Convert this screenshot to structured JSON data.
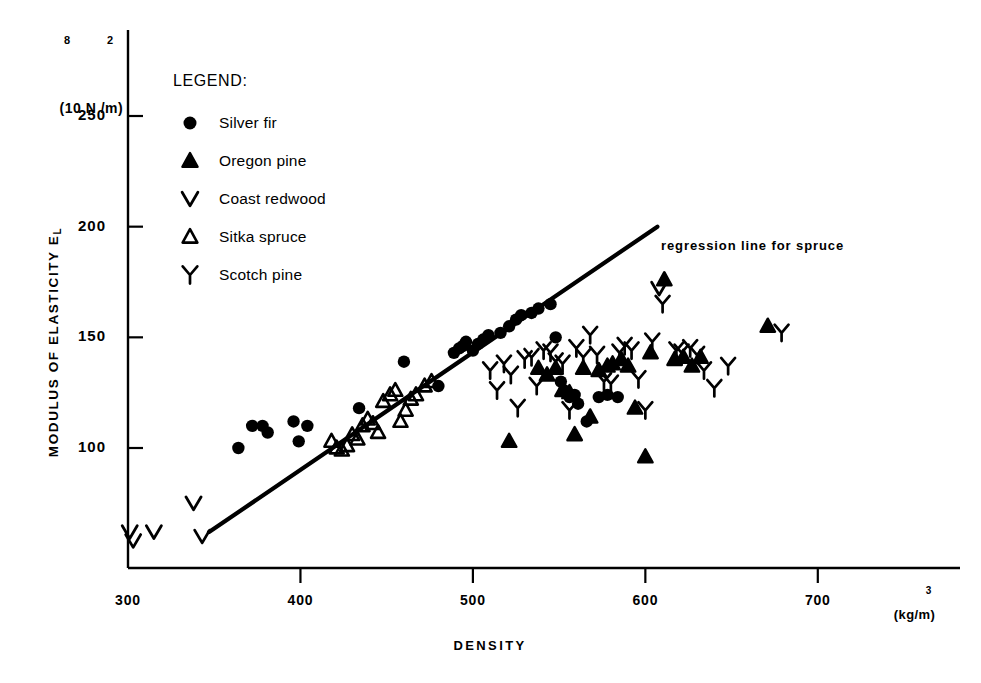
{
  "chart_data": {
    "type": "scatter",
    "title": "",
    "xlabel": "DENSITY",
    "xunit": "(kg/m",
    "xunit_exp": "3",
    "xunit_close": ")",
    "ylabel": "MODULUS OF ELASTICITY E",
    "ylabel_sub": "L",
    "yunit_open": "(10",
    "yunit_exp1": "8",
    "yunit_mid": " N /m",
    "yunit_exp2": "2",
    "yunit_close": ")",
    "xlim": [
      300,
      730
    ],
    "ylim": [
      55,
      270
    ],
    "xticks": [
      300,
      400,
      500,
      600,
      700
    ],
    "xtick_labels": [
      "300",
      "400",
      "500",
      "600",
      "700"
    ],
    "yticks": [
      100,
      150,
      200,
      250
    ],
    "ytick_labels": [
      "100",
      "150",
      "200",
      "250"
    ],
    "grid": false,
    "legend_position": "upper-left-inside",
    "legend_title": "LEGEND:",
    "annotations": [
      {
        "text": "regression line for spruce",
        "x": 615,
        "y": 197
      }
    ],
    "regression_line": {
      "label": "regression line for spruce",
      "x_start": 347,
      "y_start": 62,
      "x_end": 607,
      "y_end": 200
    },
    "series": [
      {
        "name": "Silver fir",
        "marker": "filled-circle",
        "color": "#000000",
        "points": [
          [
            364,
            100
          ],
          [
            372,
            110
          ],
          [
            378,
            110
          ],
          [
            381,
            107
          ],
          [
            396,
            112
          ],
          [
            399,
            103
          ],
          [
            404,
            110
          ],
          [
            434,
            118
          ],
          [
            460,
            139
          ],
          [
            480,
            128
          ],
          [
            489,
            143
          ],
          [
            492,
            145
          ],
          [
            494,
            146
          ],
          [
            496,
            148
          ],
          [
            500,
            144
          ],
          [
            503,
            147
          ],
          [
            506,
            149
          ],
          [
            509,
            151
          ],
          [
            516,
            152
          ],
          [
            521,
            155
          ],
          [
            525,
            158
          ],
          [
            528,
            160
          ],
          [
            534,
            161
          ],
          [
            538,
            163
          ],
          [
            545,
            165
          ],
          [
            548,
            150
          ],
          [
            551,
            130
          ],
          [
            553,
            126
          ],
          [
            556,
            123
          ],
          [
            559,
            124
          ],
          [
            561,
            120
          ],
          [
            566,
            112
          ],
          [
            573,
            123
          ],
          [
            578,
            124
          ],
          [
            584,
            123
          ]
        ]
      },
      {
        "name": "Oregon pine",
        "marker": "filled-triangle",
        "color": "#000000",
        "points": [
          [
            521,
            103
          ],
          [
            538,
            136
          ],
          [
            543,
            133
          ],
          [
            548,
            136
          ],
          [
            552,
            126
          ],
          [
            556,
            125
          ],
          [
            559,
            106
          ],
          [
            564,
            136
          ],
          [
            568,
            114
          ],
          [
            573,
            135
          ],
          [
            578,
            137
          ],
          [
            581,
            138
          ],
          [
            586,
            140
          ],
          [
            590,
            137
          ],
          [
            594,
            118
          ],
          [
            600,
            96
          ],
          [
            603,
            143
          ],
          [
            611,
            176
          ],
          [
            617,
            140
          ],
          [
            622,
            141
          ],
          [
            627,
            137
          ],
          [
            632,
            141
          ],
          [
            671,
            155
          ]
        ]
      },
      {
        "name": "Coast redwood",
        "marker": "v-glyph",
        "color": "#000000",
        "points": [
          [
            301,
            62
          ],
          [
            303,
            58
          ],
          [
            315,
            62
          ],
          [
            338,
            75
          ],
          [
            343,
            60
          ],
          [
            608,
            172
          ]
        ]
      },
      {
        "name": "Sitka spruce",
        "marker": "open-triangle",
        "color": "#000000",
        "points": [
          [
            418,
            103
          ],
          [
            421,
            100
          ],
          [
            424,
            99
          ],
          [
            427,
            101
          ],
          [
            430,
            106
          ],
          [
            433,
            104
          ],
          [
            436,
            110
          ],
          [
            439,
            113
          ],
          [
            442,
            111
          ],
          [
            445,
            107
          ],
          [
            448,
            121
          ],
          [
            452,
            124
          ],
          [
            455,
            126
          ],
          [
            458,
            112
          ],
          [
            461,
            117
          ],
          [
            464,
            122
          ],
          [
            467,
            124
          ],
          [
            472,
            128
          ],
          [
            476,
            130
          ]
        ]
      },
      {
        "name": "Scotch pine",
        "marker": "y-glyph",
        "color": "#000000",
        "points": [
          [
            510,
            135
          ],
          [
            514,
            126
          ],
          [
            518,
            138
          ],
          [
            522,
            133
          ],
          [
            526,
            118
          ],
          [
            530,
            140
          ],
          [
            534,
            141
          ],
          [
            537,
            128
          ],
          [
            541,
            144
          ],
          [
            545,
            143
          ],
          [
            548,
            139
          ],
          [
            552,
            138
          ],
          [
            556,
            117
          ],
          [
            560,
            145
          ],
          [
            564,
            141
          ],
          [
            568,
            151
          ],
          [
            572,
            142
          ],
          [
            576,
            130
          ],
          [
            580,
            129
          ],
          [
            585,
            143
          ],
          [
            588,
            146
          ],
          [
            592,
            144
          ],
          [
            596,
            131
          ],
          [
            600,
            117
          ],
          [
            604,
            148
          ],
          [
            610,
            165
          ],
          [
            618,
            144
          ],
          [
            621,
            143
          ],
          [
            626,
            145
          ],
          [
            630,
            142
          ],
          [
            634,
            135
          ],
          [
            640,
            127
          ],
          [
            648,
            137
          ],
          [
            679,
            152
          ]
        ]
      }
    ]
  },
  "legend": {
    "title": "LEGEND:",
    "items": [
      {
        "label": "Silver fir",
        "marker": "filled-circle"
      },
      {
        "label": "Oregon pine",
        "marker": "filled-triangle"
      },
      {
        "label": "Coast redwood",
        "marker": "v-glyph"
      },
      {
        "label": "Sitka spruce",
        "marker": "open-triangle"
      },
      {
        "label": "Scotch pine",
        "marker": "y-glyph"
      }
    ]
  },
  "axes": {
    "y_title_main": "MODULUS OF ELASTICITY E",
    "y_title_sub": "L",
    "x_title": "DENSITY"
  }
}
